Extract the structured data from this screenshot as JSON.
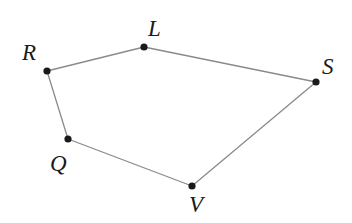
{
  "figure": {
    "type": "geometry-diagram",
    "shape_name": "pentagon-RLSVQ",
    "width": 352,
    "height": 223,
    "background_color": "#ffffff",
    "edge_color": "#8a8a8a",
    "edge_width": 1.3,
    "vertex_color": "#1a1a1a",
    "vertex_radius": 3.6,
    "label_color": "#1a1a1a",
    "label_font_size": 23,
    "label_style": "italic-serif"
  },
  "chart_data": {
    "type": "scatter",
    "title": "",
    "xlabel": "",
    "ylabel": "",
    "grid": false,
    "legend": "none",
    "xlim": [
      0,
      352
    ],
    "ylim": [
      223,
      0
    ],
    "vertices": [
      {
        "label": "R",
        "x": 47,
        "y": 71,
        "label_x": 22,
        "label_y": 60
      },
      {
        "label": "L",
        "x": 144,
        "y": 47,
        "label_x": 148,
        "label_y": 36
      },
      {
        "label": "S",
        "x": 316,
        "y": 82,
        "label_x": 322,
        "label_y": 74
      },
      {
        "label": "V",
        "x": 192,
        "y": 186,
        "label_x": 189,
        "label_y": 212
      },
      {
        "label": "Q",
        "x": 68,
        "y": 139,
        "label_x": 50,
        "label_y": 171
      }
    ],
    "edges": [
      {
        "name": "edge-R-L",
        "from": "R",
        "to": "L"
      },
      {
        "name": "edge-L-S",
        "from": "L",
        "to": "S"
      },
      {
        "name": "edge-S-V",
        "from": "S",
        "to": "V"
      },
      {
        "name": "edge-V-Q",
        "from": "V",
        "to": "Q"
      },
      {
        "name": "edge-Q-R",
        "from": "Q",
        "to": "R"
      }
    ],
    "polygon_path": "R,L,S,V,Q,close"
  }
}
